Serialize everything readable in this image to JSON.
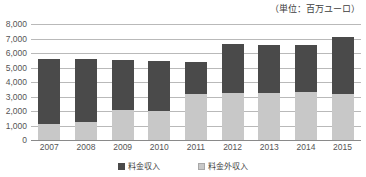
{
  "unit_note": "（単位：百万ユーロ）",
  "legend": {
    "position": "bottom-center",
    "entries": [
      {
        "label": "料金収入",
        "color": "#4a4a4a",
        "icon": "square-swatch-icon"
      },
      {
        "label": "料金外収入",
        "color": "#c8c8c8",
        "icon": "square-swatch-icon"
      }
    ]
  },
  "chart_data": {
    "type": "bar",
    "stacked": true,
    "title": "",
    "subtitle": "",
    "xlabel": "",
    "ylabel": "",
    "unit": "百万ユーロ",
    "grid": true,
    "ylim": [
      0,
      8000
    ],
    "ytick_step": 1000,
    "ytick_labels": [
      "0",
      "1,000",
      "2,000",
      "3,000",
      "4,000",
      "5,000",
      "6,000",
      "7,000",
      "8,000"
    ],
    "ytick_values": [
      0,
      1000,
      2000,
      3000,
      4000,
      5000,
      6000,
      7000,
      8000
    ],
    "categories": [
      "2007",
      "2008",
      "2009",
      "2010",
      "2011",
      "2012",
      "2013",
      "2014",
      "2015"
    ],
    "series": [
      {
        "name": "料金外収入",
        "color": "#c8c8c8",
        "stack_order": 0,
        "values": [
          1100,
          1250,
          2050,
          2000,
          3200,
          3250,
          3250,
          3300,
          3200
        ]
      },
      {
        "name": "料金収入",
        "color": "#4a4a4a",
        "stack_order": 1,
        "values": [
          4500,
          4350,
          3450,
          3450,
          2200,
          3350,
          3300,
          3250,
          3900
        ]
      }
    ],
    "totals": [
      5600,
      5600,
      5500,
      5450,
      5400,
      6600,
      6550,
      6550,
      7100
    ]
  }
}
